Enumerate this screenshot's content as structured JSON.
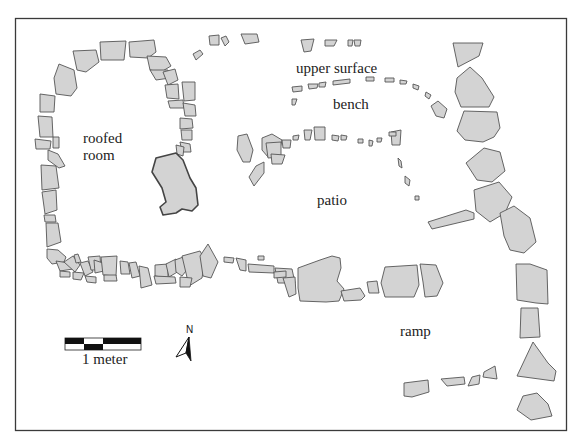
{
  "diagram": {
    "type": "archaeological site plan",
    "labels": {
      "upper_surface": "upper surface",
      "bench": "bench",
      "roofed_room_line1": "roofed",
      "roofed_room_line2": "room",
      "patio": "patio",
      "ramp": "ramp"
    },
    "scale_bar": {
      "label": "1 meter",
      "segments": 4
    },
    "north_arrow": {
      "label": "N"
    },
    "colors": {
      "stone_fill": "#d3d3d3",
      "stone_outline": "#555555",
      "frame": "#3a3a3a",
      "background": "#ffffff"
    }
  }
}
